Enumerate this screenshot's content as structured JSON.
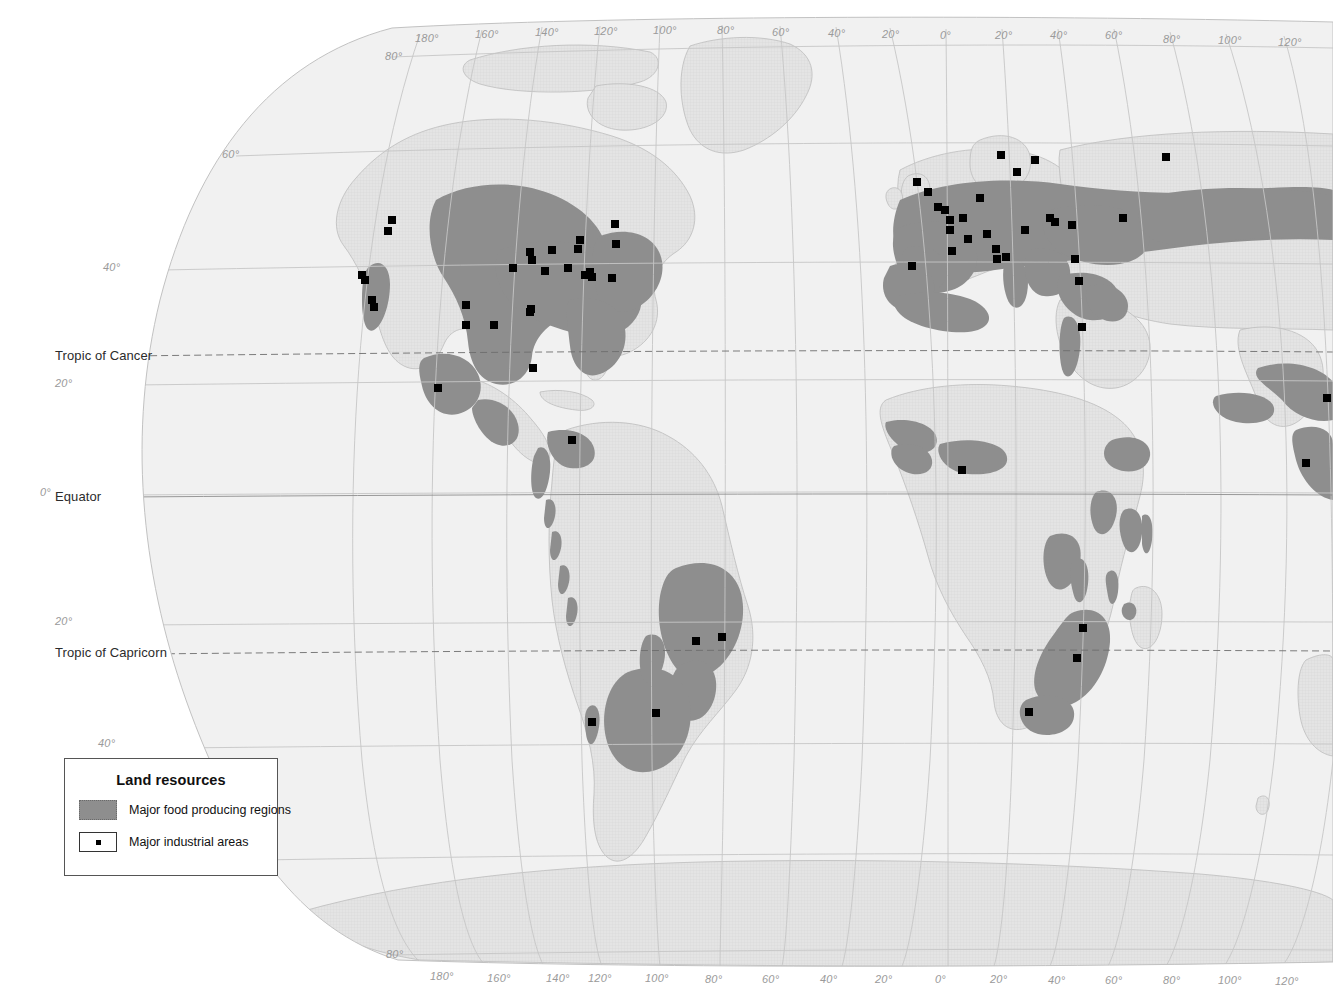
{
  "map": {
    "projection_note": "interrupted oval world projection",
    "colors": {
      "background": "#ffffff",
      "ocean": "#f2f2f2",
      "land": "#e2e2e2",
      "land_outline": "#b9b9b9",
      "food_region": "#8e8e8e",
      "graticule": "#c9c9c9",
      "tropic_line": "#6d6d6d",
      "industrial_dot": "#000000",
      "label_grid": "#9a9a9a",
      "label_named": "#2b2b2b",
      "legend_border": "#555555"
    }
  },
  "legend": {
    "title": "Land resources",
    "items": [
      {
        "swatch": "area-swatch",
        "label": "Major food producing regions"
      },
      {
        "swatch": "dot-swatch",
        "label": "Major industrial areas"
      }
    ]
  },
  "named_latitudes": [
    {
      "id": "tropic-of-cancer",
      "label": "Tropic of Cancer",
      "x": 55,
      "y": 348
    },
    {
      "id": "equator",
      "label": "Equator",
      "x": 55,
      "y": 489
    },
    {
      "id": "tropic-of-capricorn",
      "label": "Tropic of Capricorn",
      "x": 55,
      "y": 645
    }
  ],
  "latitude_labels_left": [
    {
      "label": "80°",
      "x": 385,
      "y": 50
    },
    {
      "label": "60°",
      "x": 222,
      "y": 148
    },
    {
      "label": "40°",
      "x": 103,
      "y": 261
    },
    {
      "label": "20°",
      "x": 55,
      "y": 377
    },
    {
      "label": "0°",
      "x": 40,
      "y": 486
    },
    {
      "label": "20°",
      "x": 55,
      "y": 615
    },
    {
      "label": "40°",
      "x": 98,
      "y": 737
    },
    {
      "label": "80°",
      "x": 386,
      "y": 948
    }
  ],
  "longitude_labels_top": [
    {
      "label": "180°",
      "x": 415,
      "y": 32
    },
    {
      "label": "160°",
      "x": 475,
      "y": 28
    },
    {
      "label": "140°",
      "x": 535,
      "y": 26
    },
    {
      "label": "120°",
      "x": 594,
      "y": 25
    },
    {
      "label": "100°",
      "x": 653,
      "y": 24
    },
    {
      "label": "80°",
      "x": 717,
      "y": 24
    },
    {
      "label": "60°",
      "x": 772,
      "y": 26
    },
    {
      "label": "40°",
      "x": 828,
      "y": 27
    },
    {
      "label": "20°",
      "x": 882,
      "y": 28
    },
    {
      "label": "0°",
      "x": 940,
      "y": 29
    },
    {
      "label": "20°",
      "x": 995,
      "y": 29
    },
    {
      "label": "40°",
      "x": 1050,
      "y": 29
    },
    {
      "label": "60°",
      "x": 1105,
      "y": 29
    },
    {
      "label": "80°",
      "x": 1163,
      "y": 33
    },
    {
      "label": "100°",
      "x": 1218,
      "y": 34
    },
    {
      "label": "120°",
      "x": 1278,
      "y": 36
    }
  ],
  "longitude_labels_bottom": [
    {
      "label": "180°",
      "x": 430,
      "y": 970
    },
    {
      "label": "160°",
      "x": 487,
      "y": 972
    },
    {
      "label": "140°",
      "x": 546,
      "y": 972
    },
    {
      "label": "120°",
      "x": 588,
      "y": 972
    },
    {
      "label": "100°",
      "x": 645,
      "y": 972
    },
    {
      "label": "80°",
      "x": 705,
      "y": 973
    },
    {
      "label": "60°",
      "x": 762,
      "y": 973
    },
    {
      "label": "40°",
      "x": 820,
      "y": 973
    },
    {
      "label": "20°",
      "x": 875,
      "y": 973
    },
    {
      "label": "0°",
      "x": 935,
      "y": 973
    },
    {
      "label": "20°",
      "x": 990,
      "y": 973
    },
    {
      "label": "40°",
      "x": 1048,
      "y": 974
    },
    {
      "label": "60°",
      "x": 1105,
      "y": 974
    },
    {
      "label": "80°",
      "x": 1163,
      "y": 974
    },
    {
      "label": "100°",
      "x": 1218,
      "y": 974
    },
    {
      "label": "120°",
      "x": 1275,
      "y": 975
    }
  ],
  "industrial_areas": [
    {
      "x": 392,
      "y": 220
    },
    {
      "x": 388,
      "y": 231
    },
    {
      "x": 362,
      "y": 275
    },
    {
      "x": 365,
      "y": 280
    },
    {
      "x": 372,
      "y": 300
    },
    {
      "x": 374,
      "y": 307
    },
    {
      "x": 466,
      "y": 305
    },
    {
      "x": 466,
      "y": 325
    },
    {
      "x": 494,
      "y": 325
    },
    {
      "x": 513,
      "y": 268
    },
    {
      "x": 530,
      "y": 252
    },
    {
      "x": 532,
      "y": 260
    },
    {
      "x": 552,
      "y": 250
    },
    {
      "x": 545,
      "y": 271
    },
    {
      "x": 568,
      "y": 268
    },
    {
      "x": 578,
      "y": 249
    },
    {
      "x": 580,
      "y": 240
    },
    {
      "x": 585,
      "y": 275
    },
    {
      "x": 590,
      "y": 272
    },
    {
      "x": 592,
      "y": 277
    },
    {
      "x": 615,
      "y": 224
    },
    {
      "x": 616,
      "y": 244
    },
    {
      "x": 612,
      "y": 278
    },
    {
      "x": 531,
      "y": 309
    },
    {
      "x": 530,
      "y": 312
    },
    {
      "x": 533,
      "y": 368
    },
    {
      "x": 438,
      "y": 388
    },
    {
      "x": 572,
      "y": 440
    },
    {
      "x": 696,
      "y": 641
    },
    {
      "x": 722,
      "y": 637
    },
    {
      "x": 656,
      "y": 713
    },
    {
      "x": 592,
      "y": 722
    },
    {
      "x": 912,
      "y": 266
    },
    {
      "x": 917,
      "y": 182
    },
    {
      "x": 928,
      "y": 192
    },
    {
      "x": 938,
      "y": 207
    },
    {
      "x": 945,
      "y": 210
    },
    {
      "x": 950,
      "y": 220
    },
    {
      "x": 950,
      "y": 230
    },
    {
      "x": 952,
      "y": 251
    },
    {
      "x": 963,
      "y": 218
    },
    {
      "x": 968,
      "y": 239
    },
    {
      "x": 980,
      "y": 198
    },
    {
      "x": 987,
      "y": 234
    },
    {
      "x": 996,
      "y": 249
    },
    {
      "x": 1001,
      "y": 155
    },
    {
      "x": 997,
      "y": 259
    },
    {
      "x": 1006,
      "y": 257
    },
    {
      "x": 1017,
      "y": 172
    },
    {
      "x": 1025,
      "y": 230
    },
    {
      "x": 1035,
      "y": 160
    },
    {
      "x": 1050,
      "y": 218
    },
    {
      "x": 1055,
      "y": 222
    },
    {
      "x": 1072,
      "y": 225
    },
    {
      "x": 1075,
      "y": 259
    },
    {
      "x": 1079,
      "y": 281
    },
    {
      "x": 1082,
      "y": 327
    },
    {
      "x": 1123,
      "y": 218
    },
    {
      "x": 1166,
      "y": 157
    },
    {
      "x": 962,
      "y": 470
    },
    {
      "x": 1083,
      "y": 628
    },
    {
      "x": 1077,
      "y": 658
    },
    {
      "x": 1029,
      "y": 712
    },
    {
      "x": 1327,
      "y": 398
    },
    {
      "x": 1306,
      "y": 463
    }
  ]
}
